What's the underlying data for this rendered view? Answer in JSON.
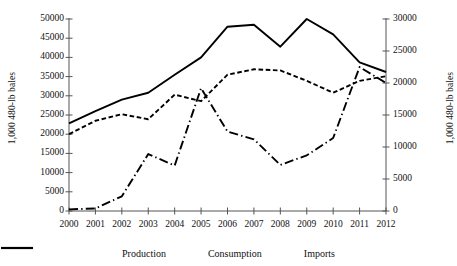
{
  "chart_data": {
    "type": "line",
    "title": "",
    "xlabel": "",
    "ylabel": "1,000 480-lb bales",
    "ylabel_right": "1,000 480-lb bales",
    "categories": [
      "2000",
      "2001",
      "2002",
      "2003",
      "2004",
      "2005",
      "2006",
      "2007",
      "2008",
      "2009",
      "2010",
      "2011",
      "2012"
    ],
    "x": [
      2000,
      2001,
      2002,
      2003,
      2004,
      2005,
      2006,
      2007,
      2008,
      2009,
      2010,
      2011,
      2012
    ],
    "ylim": [
      0,
      50000
    ],
    "ylim_right": [
      0,
      30000
    ],
    "ytick_labels": [
      "0",
      "5000",
      "10000",
      "15000",
      "20000",
      "25000",
      "30000",
      "35000",
      "40000",
      "45000",
      "50000"
    ],
    "ytick_values": [
      0,
      5000,
      10000,
      15000,
      20000,
      25000,
      30000,
      35000,
      40000,
      45000,
      50000
    ],
    "ytick_labels_right": [
      "0",
      "5000",
      "10000",
      "15000",
      "20000",
      "25000",
      "30000"
    ],
    "ytick_values_right": [
      0,
      5000,
      10000,
      15000,
      20000,
      25000,
      30000
    ],
    "grid": false,
    "legend_position": "bottom",
    "series": [
      {
        "name": "Production",
        "axis": "left",
        "style": "dashed",
        "values": [
          20000,
          23500,
          25200,
          23900,
          30300,
          28600,
          35500,
          36900,
          36600,
          33900,
          30800,
          33900,
          35100
        ]
      },
      {
        "name": "Consumption",
        "axis": "left",
        "style": "solid",
        "values": [
          22800,
          26000,
          29000,
          30800,
          35500,
          40000,
          48000,
          48500,
          42800,
          50000,
          46000,
          38700,
          36200
        ]
      },
      {
        "name": "Imports",
        "axis": "right",
        "style": "dash-dot",
        "values": [
          250,
          400,
          2300,
          8900,
          7100,
          19200,
          12400,
          11200,
          7200,
          8700,
          11400,
          22500,
          20000
        ]
      }
    ]
  },
  "legend": {
    "items": [
      {
        "label": "Production",
        "style": "dashed"
      },
      {
        "label": "Consumption",
        "style": "solid"
      },
      {
        "label": "Imports",
        "style": "dash-dot"
      }
    ]
  }
}
